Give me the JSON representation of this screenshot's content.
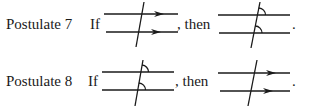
{
  "postulates": [
    {
      "label": "Postulate 7",
      "if_word": "If",
      "then_word": ", then",
      "end_mark": ".",
      "premise": "parallel-lines-marked-with-arrows-cut-by-transversal",
      "conclusion": "corresponding-angles-congruent"
    },
    {
      "label": "Postulate 8",
      "if_word": "If",
      "then_word": ", then",
      "end_mark": ".",
      "premise": "corresponding-angles-congruent",
      "conclusion": "parallel-lines-marked-with-arrows-cut-by-transversal"
    }
  ],
  "colors": {
    "ink": "#1a1a1a",
    "background": "#ffffff"
  }
}
